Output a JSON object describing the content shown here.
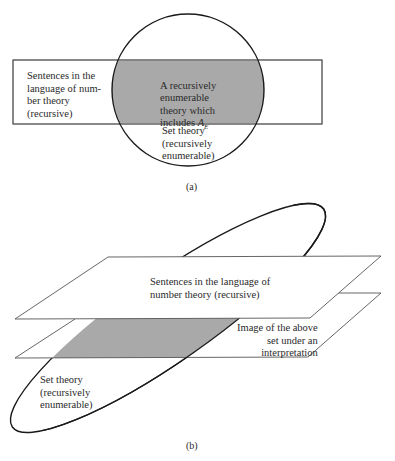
{
  "figure_a": {
    "caption": "(a)",
    "rectangle_label": "Sentences in the\nlanguage of num-\nber theory\n(recursive)",
    "intersection_label": "A recursively\nenumerable\ntheory which\nincludes",
    "intersection_symbol": "A",
    "intersection_subscript": "E",
    "circle_label": "Set theory\n(recursively\nenumerable)"
  },
  "figure_b": {
    "caption": "(b)",
    "top_plane_label": "Sentences in the language of\nnumber theory (recursive)",
    "lower_plane_label": "Image of the above\nset under an\ninterpretation",
    "ellipse_label": "Set theory\n(recursively\nenumerable)"
  },
  "colors": {
    "shade": "#a9a9a9",
    "line": "#1a1a1a",
    "thin_line": "#555555"
  }
}
